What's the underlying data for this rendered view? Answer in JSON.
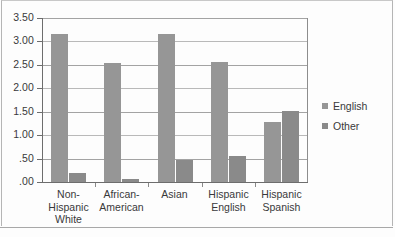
{
  "chart_data": {
    "type": "bar",
    "title": "",
    "subtitle": "",
    "xlabel": "",
    "ylabel": "",
    "categories": [
      "Non-\nHispanic\nWhite",
      "African-\nAmerican",
      "Asian",
      "Hispanic\nEnglish",
      "Hispanic\nSpanish"
    ],
    "series": [
      {
        "name": "English",
        "color": "#969696",
        "values": [
          3.15,
          2.55,
          3.15,
          2.57,
          1.29
        ]
      },
      {
        "name": "Other",
        "color": "#8a8a8a",
        "values": [
          0.2,
          0.07,
          0.47,
          0.55,
          1.52
        ]
      }
    ],
    "ylim": [
      0,
      3.5
    ],
    "ytick_labels": [
      "3.50",
      "3.00",
      "2.50",
      "2.00",
      "1.50",
      "1.00",
      ".50",
      ".00"
    ],
    "ytick_values": [
      3.5,
      3.0,
      2.5,
      2.0,
      1.5,
      1.0,
      0.5,
      0.0
    ],
    "grid": "horizontal",
    "legend_position": "right",
    "legend": [
      "English",
      "Other"
    ]
  }
}
